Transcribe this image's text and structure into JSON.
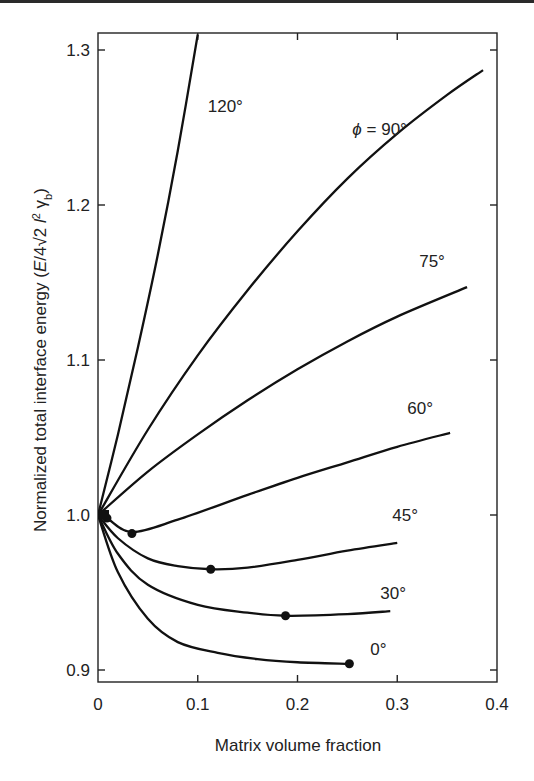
{
  "chart_data": {
    "type": "line",
    "title": "",
    "xlabel": "Matrix volume fraction",
    "ylabel": "Normalized total interface energy (E/4√2 l² γb)",
    "xlim": [
      0,
      0.4
    ],
    "ylim": [
      0.89,
      1.31
    ],
    "xticks": [
      0,
      0.1,
      0.2,
      0.3,
      0.4
    ],
    "xtick_labels": [
      "0",
      "0.1",
      "0.2",
      "0.3",
      "0.4"
    ],
    "yticks": [
      0.9,
      1.0,
      1.1,
      1.2,
      1.3
    ],
    "ytick_labels": [
      "0.9",
      "1.0",
      "1.1",
      "1.2",
      "1.3"
    ],
    "grid": false,
    "legend": "inline labels",
    "series": [
      {
        "name": "120°",
        "label": "120°",
        "x": [
          0,
          0.02,
          0.04,
          0.06,
          0.08,
          0.1
        ],
        "y": [
          1.0,
          1.052,
          1.108,
          1.168,
          1.235,
          1.31
        ],
        "min_marker": null
      },
      {
        "name": "ϕ = 90°",
        "label": "ϕ = 90°",
        "x": [
          0,
          0.05,
          0.1,
          0.15,
          0.2,
          0.25,
          0.3,
          0.35,
          0.386
        ],
        "y": [
          1.0,
          1.055,
          1.103,
          1.145,
          1.183,
          1.217,
          1.246,
          1.271,
          1.287
        ],
        "min_marker": null
      },
      {
        "name": "75°",
        "label": "75°",
        "x": [
          0,
          0.05,
          0.1,
          0.15,
          0.2,
          0.25,
          0.3,
          0.37
        ],
        "y": [
          1.0,
          1.028,
          1.052,
          1.074,
          1.094,
          1.112,
          1.128,
          1.147
        ],
        "min_marker": [
          0.009,
          0.998
        ]
      },
      {
        "name": "60°",
        "label": "60°",
        "x": [
          0,
          0.009,
          0.034,
          0.08,
          0.15,
          0.2,
          0.25,
          0.3,
          0.353
        ],
        "y": [
          1.0,
          0.998,
          0.989,
          0.997,
          1.013,
          1.024,
          1.034,
          1.044,
          1.053
        ],
        "min_marker": [
          0.034,
          0.988
        ]
      },
      {
        "name": "45°",
        "label": "45°",
        "x": [
          0,
          0.02,
          0.05,
          0.08,
          0.113,
          0.15,
          0.2,
          0.25,
          0.3
        ],
        "y": [
          1.0,
          0.985,
          0.972,
          0.967,
          0.965,
          0.966,
          0.971,
          0.977,
          0.982
        ],
        "min_marker": [
          0.113,
          0.965
        ]
      },
      {
        "name": "30°",
        "label": "30°",
        "x": [
          0,
          0.02,
          0.05,
          0.1,
          0.15,
          0.188,
          0.25,
          0.293
        ],
        "y": [
          1.0,
          0.975,
          0.955,
          0.942,
          0.937,
          0.935,
          0.936,
          0.938
        ],
        "min_marker": [
          0.188,
          0.935
        ]
      },
      {
        "name": "0°",
        "label": "0°",
        "x": [
          0,
          0.02,
          0.05,
          0.08,
          0.12,
          0.16,
          0.2,
          0.252
        ],
        "y": [
          1.0,
          0.963,
          0.933,
          0.918,
          0.911,
          0.907,
          0.905,
          0.904
        ],
        "min_marker": [
          0.252,
          0.904
        ]
      }
    ],
    "label_positions": [
      {
        "text": "120°",
        "x": 0.11,
        "y": 1.26
      },
      {
        "text": "ϕ = 90°",
        "x": 0.255,
        "y": 1.245
      },
      {
        "text": "75°",
        "x": 0.322,
        "y": 1.16
      },
      {
        "text": "60°",
        "x": 0.31,
        "y": 1.065
      },
      {
        "text": "45°",
        "x": 0.295,
        "y": 0.996
      },
      {
        "text": "30°",
        "x": 0.283,
        "y": 0.946
      },
      {
        "text": "0°",
        "x": 0.273,
        "y": 0.91
      }
    ]
  }
}
